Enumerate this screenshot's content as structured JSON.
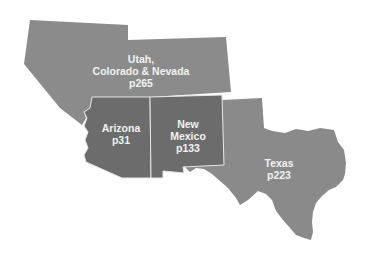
{
  "colors": {
    "background": "#ffffff",
    "region_light": "#8b8b8b",
    "region_dark": "#6c6c6c",
    "texas": "#8a8a8a",
    "border": "#e6e6e6",
    "label_text": "#f2f2f2"
  },
  "regions": [
    {
      "id": "utah-colorado-nevada",
      "lines": [
        "Utah,",
        "Colorado & Nevada",
        "p265"
      ]
    },
    {
      "id": "arizona",
      "lines": [
        "Arizona",
        "p31"
      ]
    },
    {
      "id": "new-mexico",
      "lines": [
        "New",
        "Mexico",
        "p133"
      ]
    },
    {
      "id": "texas",
      "lines": [
        "Texas",
        "p223"
      ]
    }
  ]
}
